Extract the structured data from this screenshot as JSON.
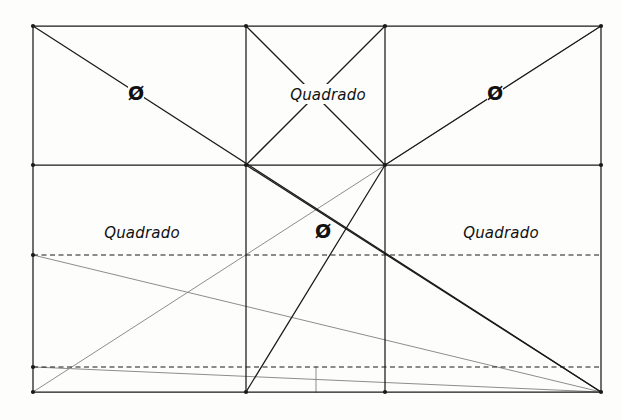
{
  "document": {
    "title": "Esquema geométrico — divisão em quadrados",
    "background_color": "#fdfdfc",
    "ink_color": "#1a1a1a",
    "faint_ink_color": "#8d8d8d",
    "width": 621,
    "height": 420
  },
  "chart_data": {
    "type": "diagram",
    "xlabel": "",
    "ylabel": "",
    "xlim": [
      0,
      621
    ],
    "ylim": [
      0,
      420
    ],
    "grid": false,
    "legend": null,
    "frame": {
      "left": 33,
      "right": 601,
      "top": 26,
      "bottom": 392
    },
    "vertical_dividers": [
      246,
      385
    ],
    "horizontal_dividers": [
      165
    ],
    "dashed_horizontals": [
      255,
      367
    ],
    "bottom_ticks": [
      316
    ],
    "nodes": [
      {
        "name": "top-left",
        "x": 33,
        "y": 26
      },
      {
        "name": "top-mid-left",
        "x": 246,
        "y": 26
      },
      {
        "name": "top-mid-right",
        "x": 385,
        "y": 26
      },
      {
        "name": "top-right",
        "x": 601,
        "y": 26
      },
      {
        "name": "mid-left",
        "x": 33,
        "y": 165
      },
      {
        "name": "center-left",
        "x": 246,
        "y": 165
      },
      {
        "name": "center-right",
        "x": 385,
        "y": 165
      },
      {
        "name": "mid-right",
        "x": 601,
        "y": 165
      },
      {
        "name": "dash1-left",
        "x": 33,
        "y": 255
      },
      {
        "name": "dash2-left",
        "x": 33,
        "y": 367
      },
      {
        "name": "bottom-left",
        "x": 33,
        "y": 392
      },
      {
        "name": "bottom-mid-left",
        "x": 246,
        "y": 392
      },
      {
        "name": "bottom-mid-right",
        "x": 385,
        "y": 392
      },
      {
        "name": "bottom-right",
        "x": 601,
        "y": 392
      }
    ],
    "series": [
      {
        "name": "frame-and-grid",
        "style": "solid-dark",
        "segments": [
          [
            33,
            26,
            601,
            26
          ],
          [
            33,
            392,
            601,
            392
          ],
          [
            33,
            26,
            33,
            392
          ],
          [
            601,
            26,
            601,
            392
          ],
          [
            33,
            165,
            601,
            165
          ],
          [
            246,
            26,
            246,
            392
          ],
          [
            385,
            26,
            385,
            392
          ]
        ]
      },
      {
        "name": "dashed-horizontals",
        "style": "dashed-dark",
        "segments": [
          [
            33,
            255,
            601,
            255
          ],
          [
            33,
            367,
            601,
            367
          ]
        ]
      },
      {
        "name": "main-diagonals",
        "style": "solid-dark",
        "segments": [
          [
            33,
            26,
            601,
            392
          ],
          [
            385,
            26,
            246,
            165
          ],
          [
            246,
            26,
            385,
            165
          ],
          [
            385,
            165,
            601,
            26
          ],
          [
            246,
            165,
            601,
            392
          ],
          [
            246,
            392,
            385,
            165
          ]
        ]
      },
      {
        "name": "lower-construction-lines",
        "style": "solid-light",
        "segments": [
          [
            33,
            255,
            601,
            392
          ],
          [
            33,
            392,
            601,
            26
          ],
          [
            33,
            367,
            601,
            392
          ]
        ]
      },
      {
        "name": "bottom-tick",
        "style": "solid-light",
        "segments": [
          [
            316,
            367,
            316,
            392
          ]
        ]
      }
    ],
    "annotations": [
      {
        "id": "sym-top-left",
        "text": "Ø",
        "x": 136,
        "y": 100,
        "kind": "symbol"
      },
      {
        "id": "word-top-center",
        "text": "Quadrado",
        "x": 328,
        "y": 100,
        "kind": "word"
      },
      {
        "id": "sym-top-right",
        "text": "Ø",
        "x": 495,
        "y": 100,
        "kind": "symbol"
      },
      {
        "id": "word-mid-left",
        "text": "Quadrado",
        "x": 142,
        "y": 238,
        "kind": "word"
      },
      {
        "id": "sym-center",
        "text": "Ø",
        "x": 323,
        "y": 238,
        "kind": "symbol"
      },
      {
        "id": "word-mid-right",
        "text": "Quadrado",
        "x": 501,
        "y": 238,
        "kind": "word"
      }
    ]
  },
  "labels": {
    "top_left_symbol": "Ø",
    "top_center_word": "Quadrado",
    "top_right_symbol": "Ø",
    "mid_left_word": "Quadrado",
    "center_symbol": "Ø",
    "mid_right_word": "Quadrado"
  }
}
